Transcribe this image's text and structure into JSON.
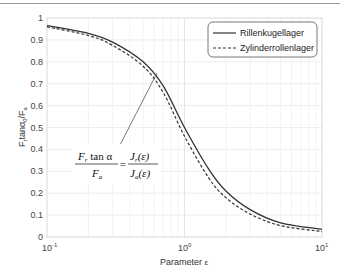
{
  "chart_data": {
    "type": "line",
    "title": "",
    "xlabel": "Parameter ε",
    "ylabel": "F_r tanα / F_a",
    "xscale": "log",
    "xlim": [
      0.1,
      10
    ],
    "ylim": [
      0,
      1
    ],
    "grid": true,
    "legend_position": "upper right",
    "x_ticks": [
      "10^-1",
      "10^0",
      "10^1"
    ],
    "y_ticks": [
      "0",
      "0.1",
      "0.2",
      "0.3",
      "0.4",
      "0.5",
      "0.6",
      "0.7",
      "0.8",
      "0.9",
      "1"
    ],
    "x": [
      0.1,
      0.2,
      0.3,
      0.5,
      0.7,
      1.0,
      1.5,
      2.0,
      3.0,
      5.0,
      10.0
    ],
    "series": [
      {
        "name": "Rillenkugellager",
        "style": "solid",
        "values": [
          0.965,
          0.93,
          0.89,
          0.8,
          0.69,
          0.5,
          0.31,
          0.21,
          0.125,
          0.065,
          0.035
        ]
      },
      {
        "name": "Zylinderrollenlager",
        "style": "dashed",
        "values": [
          0.96,
          0.92,
          0.875,
          0.78,
          0.66,
          0.46,
          0.27,
          0.18,
          0.105,
          0.052,
          0.025
        ]
      }
    ],
    "annotations": [
      {
        "text": "F_r tanα / F_a = J_r(ε) / J_a(ε)",
        "arrow_to": [
          0.62,
          0.78
        ]
      }
    ]
  },
  "labels": {
    "y0": "0",
    "y1": "0.1",
    "y2": "0.2",
    "y3": "0.3",
    "y4": "0.4",
    "y5": "0.5",
    "y6": "0.6",
    "y7": "0.7",
    "y8": "0.8",
    "y9": "0.9",
    "y10": "1",
    "x_base": "10",
    "x_exp_min": "-1",
    "x_exp_mid": "0",
    "x_exp_max": "1",
    "xlabel_text": "Parameter ",
    "xlabel_sym": "ε",
    "ylabel_main": "F",
    "ylabel_sub_r": "r",
    "ylabel_mid": "tanα",
    "ylabel_sub0": "0",
    "ylabel_slash": "/F",
    "ylabel_sub_a": "a",
    "legend_solid": "Rillenkugellager",
    "legend_dashed": "Zylinderrollenlager",
    "formula_num_left": "F",
    "formula_num_left_sub": "r",
    "formula_num_left_tail": " tan α",
    "formula_den_left": "F",
    "formula_den_left_sub": "a",
    "formula_eq": "=",
    "formula_num_right": "J",
    "formula_num_right_sub": "r",
    "formula_num_right_tail": "(ε)",
    "formula_den_right": "J",
    "formula_den_right_sub": "a",
    "formula_den_right_tail": "(ε)"
  }
}
